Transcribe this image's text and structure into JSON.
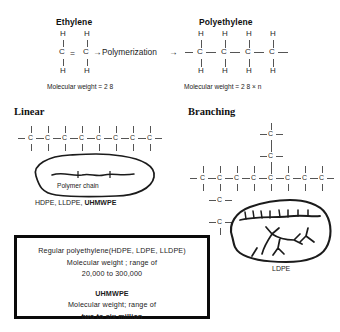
{
  "diagram": {
    "ink_color": "#1b1b1b",
    "background": "#ffffff",
    "box_border_color": "#0a0a0a"
  },
  "reaction": {
    "monomer": {
      "heading": "Ethylene",
      "carbon_label": "C",
      "hydrogen_label": "H",
      "double_bond_symbol": "=",
      "molecular_weight_text": "Molecular weight = 2 8"
    },
    "operator": {
      "arrow_left": "→",
      "label": "Polymerization",
      "arrow_right": "→"
    },
    "polymer": {
      "heading": "Polyethylene",
      "carbon_label": "C",
      "hydrogen_label": "H",
      "repeat_units": 4,
      "molecular_weight_text": "Molecular weight  = 2 8 × n"
    }
  },
  "linear": {
    "heading": "Linear",
    "carbon_label": "C",
    "carbon_count": 8,
    "bond_dash": "–",
    "callout_label": "Polymer chain",
    "grades_plain": "HDPE, LLDPE, ",
    "grades_bold": "UHMWPE"
  },
  "branching": {
    "heading": "Branching",
    "carbon_label": "C",
    "main_chain_count": 8,
    "branch_up_length": 2,
    "branch_down_length": 2,
    "grade_label": "LDPE"
  },
  "info_box": {
    "line1": "Regular polyethylene(HDPE, LDPE, LLDPE)",
    "line2": "Molecular weight ; range of",
    "line3": "20,000 to 300,000",
    "line4": "UHMWPE",
    "line5": "Molecular weight; range of",
    "line6": "two to six million"
  }
}
